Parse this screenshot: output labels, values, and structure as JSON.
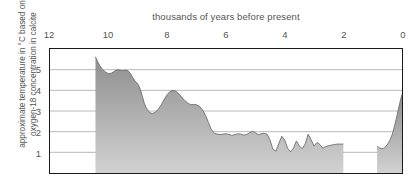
{
  "chart_data": {
    "type": "area",
    "title": "thousands of years before present",
    "xlabel": "thousands of years before present",
    "ylabel": "approximate temperature in °C based on oxygen-18 concentration in calcite",
    "ylabel_line1": "approximate temperature in °C based on",
    "ylabel_line2": "oxygen-18 concentration in calcite",
    "x_axis_position": "top",
    "x_reversed": true,
    "xlim": [
      12,
      0
    ],
    "ylim": [
      0,
      6
    ],
    "xticks": [
      12,
      10,
      8,
      6,
      4,
      2,
      0
    ],
    "xtick_labels": [
      "12",
      "10",
      "8",
      "6",
      "4",
      "2",
      "0"
    ],
    "yticks": [
      1,
      2,
      3,
      4,
      5
    ],
    "ytick_labels": [
      "1",
      "2",
      "3",
      "4",
      "5"
    ],
    "grid": true,
    "grid_axis": "y",
    "grid_color": "#9a9a9a",
    "frame_color": "#1a1a1a",
    "fill_gradient_top": "#8e8e8e",
    "fill_gradient_bottom": "#cfcfcf",
    "line_color": "#6e6e6e",
    "series_name": "approximate temperature",
    "data_gap": [
      2.0,
      0.85
    ],
    "x": [
      10.45,
      10.38,
      10.3,
      10.2,
      10.1,
      10.0,
      9.92,
      9.85,
      9.78,
      9.7,
      9.62,
      9.55,
      9.48,
      9.4,
      9.32,
      9.25,
      9.18,
      9.1,
      9.0,
      8.92,
      8.85,
      8.78,
      8.7,
      8.6,
      8.5,
      8.4,
      8.3,
      8.2,
      8.1,
      8.0,
      7.9,
      7.8,
      7.7,
      7.6,
      7.5,
      7.4,
      7.3,
      7.2,
      7.1,
      7.0,
      6.9,
      6.8,
      6.7,
      6.6,
      6.5,
      6.4,
      6.3,
      6.2,
      6.1,
      6.0,
      5.9,
      5.8,
      5.7,
      5.6,
      5.5,
      5.4,
      5.3,
      5.2,
      5.1,
      5.0,
      4.9,
      4.8,
      4.7,
      4.6,
      4.5,
      4.4,
      4.3,
      4.2,
      4.1,
      4.0,
      3.9,
      3.8,
      3.7,
      3.6,
      3.5,
      3.4,
      3.3,
      3.2,
      3.1,
      3.0,
      2.9,
      2.8,
      2.7,
      2.6,
      2.5,
      2.4,
      2.3,
      2.2,
      2.1,
      2.0,
      0.85,
      0.78,
      0.7,
      0.62,
      0.55,
      0.48,
      0.4,
      0.32,
      0.25,
      0.18,
      0.12,
      0.06,
      0.0
    ],
    "y": [
      5.62,
      5.4,
      5.18,
      5.0,
      4.88,
      4.8,
      4.82,
      4.88,
      4.95,
      5.0,
      4.98,
      4.95,
      4.96,
      4.98,
      4.92,
      4.8,
      4.62,
      4.45,
      4.3,
      4.05,
      3.7,
      3.35,
      3.1,
      2.92,
      2.88,
      2.95,
      3.1,
      3.32,
      3.58,
      3.8,
      3.95,
      4.0,
      3.95,
      3.82,
      3.65,
      3.5,
      3.38,
      3.3,
      3.32,
      3.3,
      3.22,
      3.05,
      2.8,
      2.45,
      2.1,
      1.92,
      1.88,
      1.86,
      1.88,
      1.9,
      1.86,
      1.82,
      1.85,
      1.9,
      1.88,
      1.84,
      1.86,
      1.95,
      2.02,
      1.95,
      1.85,
      1.9,
      1.92,
      1.88,
      1.6,
      1.15,
      1.05,
      1.42,
      1.78,
      1.6,
      1.2,
      1.02,
      1.2,
      1.55,
      1.3,
      1.18,
      1.4,
      1.88,
      1.62,
      1.3,
      1.48,
      1.38,
      1.2,
      1.28,
      1.32,
      1.35,
      1.38,
      1.4,
      1.4,
      1.4,
      1.3,
      1.22,
      1.18,
      1.2,
      1.28,
      1.42,
      1.62,
      1.92,
      2.3,
      2.72,
      3.1,
      3.48,
      3.8
    ]
  }
}
